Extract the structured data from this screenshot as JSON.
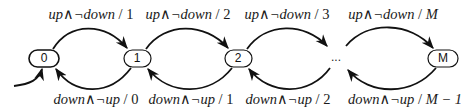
{
  "diagram": {
    "type": "state-machine",
    "nodes": [
      {
        "id": "0",
        "label": "0",
        "cx": 44,
        "cy": 58
      },
      {
        "id": "1",
        "label": "1",
        "cx": 137,
        "cy": 58
      },
      {
        "id": "2",
        "label": "2",
        "cx": 238,
        "cy": 58
      },
      {
        "id": "M",
        "label": "M",
        "cx": 443,
        "cy": 58
      }
    ],
    "ellipsis": {
      "label": "...",
      "cx": 336,
      "cy": 58
    },
    "initial_arrow": {
      "to": "0"
    },
    "forward_edges": [
      {
        "from": "0",
        "to": "1",
        "guard_a": "up",
        "op": "∧",
        "guard_b": "¬down",
        "sep": " / ",
        "output": "1"
      },
      {
        "from": "1",
        "to": "2",
        "guard_a": "up",
        "op": "∧",
        "guard_b": "¬down",
        "sep": " / ",
        "output": "2"
      },
      {
        "from": "2",
        "to": "...",
        "guard_a": "up",
        "op": "∧",
        "guard_b": "¬down",
        "sep": " / ",
        "output": "3"
      },
      {
        "from": "...",
        "to": "M",
        "guard_a": "up",
        "op": "∧",
        "guard_b": "¬down",
        "sep": " / ",
        "output": "M"
      }
    ],
    "backward_edges": [
      {
        "from": "1",
        "to": "0",
        "guard_a": "down",
        "op": "∧",
        "guard_b": "¬up",
        "sep": " / ",
        "output": "0"
      },
      {
        "from": "2",
        "to": "1",
        "guard_a": "down",
        "op": "∧",
        "guard_b": "¬up",
        "sep": " / ",
        "output": "1"
      },
      {
        "from": "...",
        "to": "2",
        "guard_a": "down",
        "op": "∧",
        "guard_b": "¬up",
        "sep": " / ",
        "output": "2"
      },
      {
        "from": "M",
        "to": "...",
        "guard_a": "down",
        "op": "∧",
        "guard_b": "¬up",
        "sep": " / ",
        "output": "M − 1"
      }
    ]
  }
}
